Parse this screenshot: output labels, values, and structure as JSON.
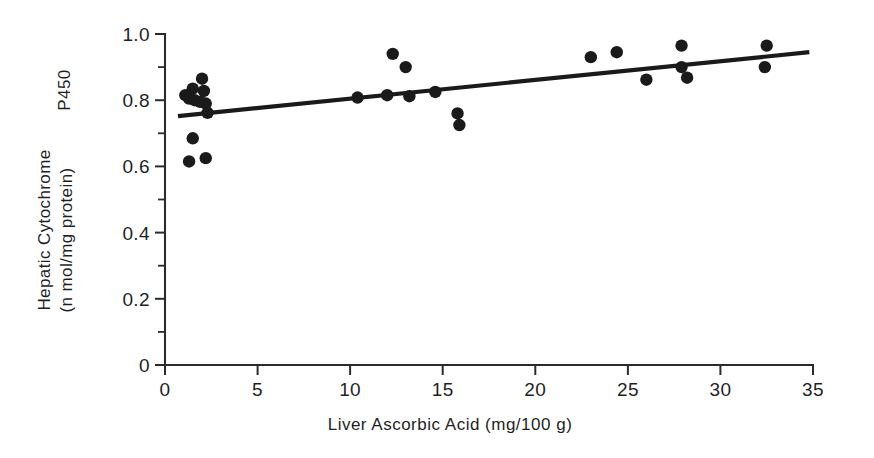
{
  "chart_data": {
    "type": "scatter",
    "title": "",
    "xlabel": "Liver Ascorbic Acid (mg/100 g)",
    "ylabel_line1": "Hepatic Cytochrome",
    "ylabel_line2": "(n mol/mg protein)",
    "ylabel_superscript": "P450",
    "xlim": [
      0,
      35
    ],
    "ylim": [
      0,
      1.0
    ],
    "grid": false,
    "legend": null,
    "xticks": [
      0,
      5,
      10,
      15,
      20,
      25,
      30,
      35
    ],
    "xticklabels": [
      "0",
      "5",
      "10",
      "15",
      "20",
      "25",
      "30",
      "35"
    ],
    "yticks": [
      0,
      0.2,
      0.4,
      0.6,
      0.8,
      1.0
    ],
    "yticklabels": [
      "0",
      "0.2",
      "0.4",
      "0.6",
      "0.8",
      "1.0"
    ],
    "yminorticks": [
      0.1,
      0.3,
      0.5,
      0.7,
      0.9
    ],
    "marker": "filled-circle",
    "marker_color": "#1a1a1a",
    "marker_size": 6.2,
    "points": [
      {
        "x": 1.1,
        "y": 0.815
      },
      {
        "x": 1.3,
        "y": 0.805
      },
      {
        "x": 1.5,
        "y": 0.835
      },
      {
        "x": 1.6,
        "y": 0.8
      },
      {
        "x": 1.9,
        "y": 0.795
      },
      {
        "x": 2.0,
        "y": 0.865
      },
      {
        "x": 2.1,
        "y": 0.828
      },
      {
        "x": 2.2,
        "y": 0.79
      },
      {
        "x": 2.3,
        "y": 0.762
      },
      {
        "x": 1.5,
        "y": 0.685
      },
      {
        "x": 1.3,
        "y": 0.615
      },
      {
        "x": 2.2,
        "y": 0.625
      },
      {
        "x": 10.4,
        "y": 0.808
      },
      {
        "x": 12.0,
        "y": 0.815
      },
      {
        "x": 12.3,
        "y": 0.94
      },
      {
        "x": 13.0,
        "y": 0.9
      },
      {
        "x": 13.2,
        "y": 0.812
      },
      {
        "x": 14.6,
        "y": 0.825
      },
      {
        "x": 15.8,
        "y": 0.76
      },
      {
        "x": 15.9,
        "y": 0.725
      },
      {
        "x": 23.0,
        "y": 0.93
      },
      {
        "x": 24.4,
        "y": 0.945
      },
      {
        "x": 26.0,
        "y": 0.862
      },
      {
        "x": 27.9,
        "y": 0.965
      },
      {
        "x": 27.9,
        "y": 0.9
      },
      {
        "x": 28.2,
        "y": 0.868
      },
      {
        "x": 32.5,
        "y": 0.965
      },
      {
        "x": 32.4,
        "y": 0.9
      }
    ],
    "fit_line": {
      "type": "linear-regression",
      "x_start": 0.7,
      "y_start": 0.752,
      "x_end": 34.8,
      "y_end": 0.945
    }
  }
}
